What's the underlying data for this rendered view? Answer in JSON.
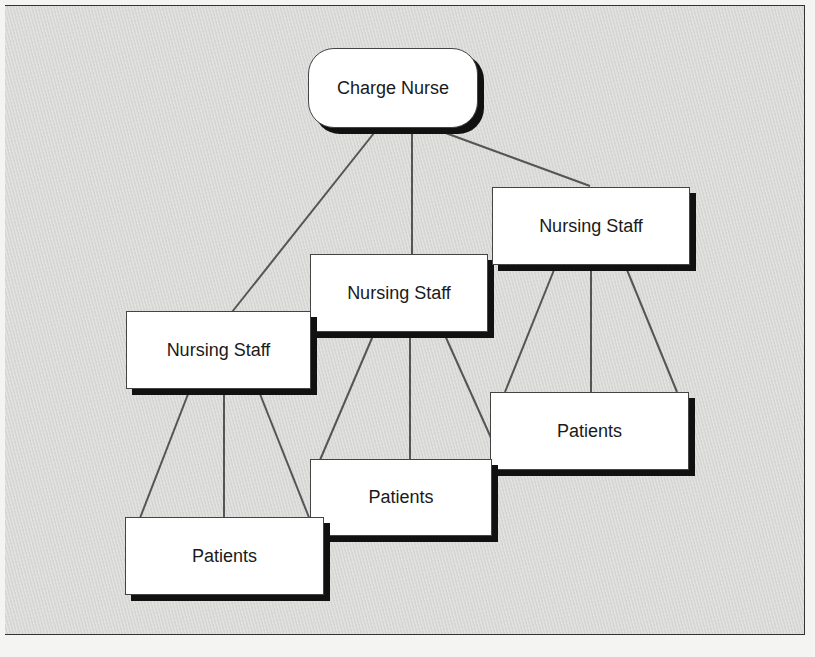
{
  "diagram": {
    "type": "org-chart",
    "root": {
      "label": "Charge Nurse"
    },
    "staff_nodes": [
      {
        "label": "Nursing Staff"
      },
      {
        "label": "Nursing Staff"
      },
      {
        "label": "Nursing Staff"
      }
    ],
    "patient_nodes": [
      {
        "label": "Patients"
      },
      {
        "label": "Patients"
      },
      {
        "label": "Patients"
      }
    ],
    "colors": {
      "background": "#dcdcda",
      "node_fill": "#ffffff",
      "shadow": "#111111",
      "line": "#555555"
    }
  }
}
